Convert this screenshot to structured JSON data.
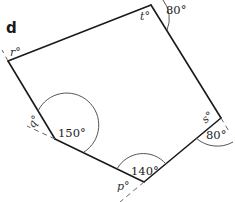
{
  "part_label": "d",
  "shape": "pentagon",
  "vertices": [
    {
      "name": "t",
      "label": "t°",
      "interior_angle": "unknown",
      "exterior_angle_label": "80°"
    },
    {
      "name": "s",
      "label": "s°",
      "interior_angle": "unknown",
      "exterior_angle_label": "80°"
    },
    {
      "name": "p",
      "label": "p°",
      "interior_angle_label": "140°"
    },
    {
      "name": "q",
      "label": "q°",
      "interior_angle_label": "150°"
    },
    {
      "name": "r",
      "label": "r°"
    }
  ],
  "labels": {
    "t_var": "t°",
    "t_ext": "80°",
    "s_var": "s°",
    "s_ext": "80°",
    "p_var": "p°",
    "p_int": "140°",
    "q_var": "q°",
    "q_int": "150°",
    "r_var": "r°"
  },
  "colors": {
    "line": "#1a1a1a",
    "arc": "#555555",
    "dash": "#666666"
  }
}
